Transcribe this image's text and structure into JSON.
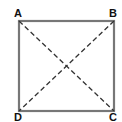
{
  "diagram": {
    "type": "square-with-diagonals",
    "vertices": [
      {
        "label": "A",
        "x": 19,
        "y": 21
      },
      {
        "label": "B",
        "x": 114,
        "y": 21
      },
      {
        "label": "C",
        "x": 114,
        "y": 111
      },
      {
        "label": "D",
        "x": 19,
        "y": 111
      }
    ],
    "sides": [
      [
        "A",
        "B"
      ],
      [
        "B",
        "C"
      ],
      [
        "C",
        "D"
      ],
      [
        "D",
        "A"
      ]
    ],
    "diagonals": [
      [
        "A",
        "C"
      ],
      [
        "B",
        "D"
      ]
    ],
    "colors": {
      "side": "#777777",
      "diagonal": "#333333",
      "label": "#111111",
      "background": "#ffffff"
    }
  },
  "labels": {
    "a": "A",
    "b": "B",
    "c": "C",
    "d": "D"
  }
}
